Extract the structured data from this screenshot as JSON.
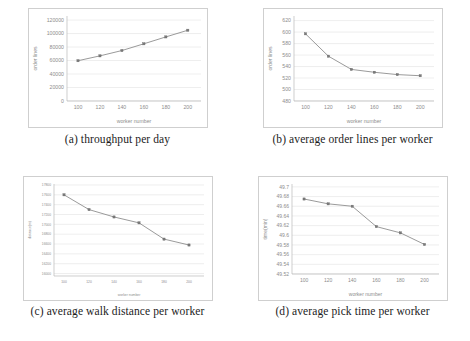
{
  "figure": {
    "subfigures": [
      {
        "key": "a",
        "caption": "(a) throughput per day",
        "chart_data": {
          "type": "line",
          "title": "",
          "xlabel": "worker number",
          "ylabel": "order lines",
          "x": [
            100,
            120,
            140,
            160,
            180,
            200
          ],
          "values": [
            59700,
            66900,
            74800,
            84800,
            95000,
            104900
          ],
          "xticklabels": [
            "100",
            "120",
            "140",
            "160",
            "180",
            "200"
          ],
          "yticklabels": [
            "0",
            "20000",
            "40000",
            "60000",
            "80000",
            "100000",
            "120000"
          ],
          "yticks": [
            0,
            20000,
            40000,
            60000,
            80000,
            100000,
            120000
          ],
          "xlim": [
            90,
            212
          ],
          "ylim": [
            0,
            126000
          ],
          "grid": true,
          "legend": "none"
        }
      },
      {
        "key": "b",
        "caption": "(b) average order lines per worker",
        "chart_data": {
          "type": "line",
          "title": "",
          "xlabel": "worker number",
          "ylabel": "order lines",
          "x": [
            100,
            120,
            140,
            160,
            180,
            200
          ],
          "values": [
            597,
            558,
            535,
            530,
            526,
            524
          ],
          "xticklabels": [
            "100",
            "120",
            "140",
            "160",
            "180",
            "200"
          ],
          "yticklabels": [
            "480",
            "500",
            "520",
            "540",
            "560",
            "580",
            "600",
            "620"
          ],
          "yticks": [
            480,
            500,
            520,
            540,
            560,
            580,
            600,
            620
          ],
          "xlim": [
            90,
            212
          ],
          "ylim": [
            480,
            628
          ],
          "grid": true,
          "legend": "none"
        }
      },
      {
        "key": "c",
        "caption": "(c) average walk distance per worker",
        "chart_data": {
          "type": "line",
          "title": "",
          "xlabel": "worker number",
          "ylabel": "distance(m)",
          "x": [
            100,
            120,
            140,
            160,
            180,
            200
          ],
          "values": [
            17600,
            17300,
            17150,
            17030,
            16700,
            16580
          ],
          "xticklabels": [
            "100",
            "120",
            "140",
            "160",
            "180",
            "200"
          ],
          "yticklabels": [
            "15400",
            "15600",
            "15800",
            "16000",
            "16200",
            "16400",
            "16600",
            "16800",
            "17000",
            "17200",
            "17400",
            "17600",
            "17800"
          ],
          "yticks": [
            16000,
            16200,
            16400,
            16600,
            16800,
            17000,
            17200,
            17400,
            17600,
            17800
          ],
          "ydisplay": [
            "16000",
            "16200",
            "16400",
            "16600",
            "16800",
            "17000",
            "17200",
            "17400",
            "17600",
            "17800"
          ],
          "xlim": [
            92,
            212
          ],
          "ylim": [
            15950,
            17820
          ],
          "grid": true,
          "legend": "none"
        }
      },
      {
        "key": "d",
        "caption": "(d) average pick time per worker",
        "chart_data": {
          "type": "line",
          "title": "",
          "xlabel": "worker number",
          "ylabel": "time(min)",
          "x": [
            100,
            120,
            140,
            160,
            180,
            200
          ],
          "values": [
            49.675,
            49.665,
            49.66,
            49.618,
            49.605,
            49.581
          ],
          "xticklabels": [
            "100",
            "120",
            "140",
            "160",
            "180",
            "200"
          ],
          "yticklabels": [
            "49.52",
            "49.54",
            "49.56",
            "49.58",
            "49.6",
            "49.62",
            "49.64",
            "49.66",
            "49.68",
            "49.7"
          ],
          "yticks": [
            49.52,
            49.54,
            49.56,
            49.58,
            49.6,
            49.62,
            49.64,
            49.66,
            49.68,
            49.7
          ],
          "xlim": [
            90,
            212
          ],
          "ylim": [
            49.52,
            49.706
          ],
          "grid": true,
          "legend": "none"
        }
      }
    ]
  },
  "colors": {
    "line": "#8f8f8f",
    "marker": "#7a7a7a",
    "grid": "#e3e3e3",
    "frame": "#cfcfcf",
    "tick_text": "#8d8d8d",
    "caption_text": "#1c1c1c",
    "background": "#ffffff"
  }
}
